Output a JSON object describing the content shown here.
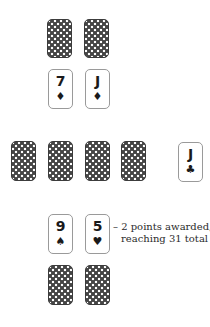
{
  "board": {
    "top_opponent": {
      "hand": [
        {
          "face": "down"
        },
        {
          "face": "down"
        }
      ],
      "played": [
        {
          "rank": "7",
          "suit": "♦",
          "suit_name": "diamonds"
        },
        {
          "rank": "J",
          "suit": "♦",
          "suit_name": "diamonds"
        }
      ]
    },
    "middle": {
      "deck_row": [
        {
          "face": "down"
        },
        {
          "face": "down"
        },
        {
          "face": "down"
        },
        {
          "face": "down"
        }
      ],
      "starter": {
        "rank": "J",
        "suit": "♣",
        "suit_name": "clubs"
      }
    },
    "bottom_player": {
      "played": [
        {
          "rank": "9",
          "suit": "♠",
          "suit_name": "spades"
        },
        {
          "rank": "5",
          "suit": "♥",
          "suit_name": "hearts"
        }
      ],
      "hand": [
        {
          "face": "down"
        },
        {
          "face": "down"
        }
      ]
    }
  },
  "score_note": {
    "line1": "– 2 points awarded,",
    "line2": "reaching 31 total"
  },
  "colors": {
    "card_back": "#454545",
    "card_border": "#9a9a9a",
    "text": "#2b2b2b"
  }
}
